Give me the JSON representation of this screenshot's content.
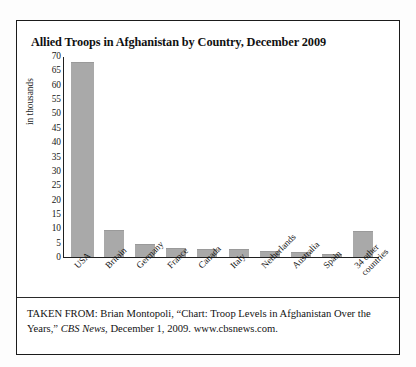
{
  "title": "Allied Troops in Afghanistan by Country, December 2009",
  "source": {
    "prefix": "TAKEN FROM: Brian Montopoli, “Chart: Troop Levels in Afghanistan Over the Years,” ",
    "publication": "CBS News",
    "suffix": ", December 1, 2009. www.cbsnews.com."
  },
  "colors": {
    "bar_fill": "#a9a9a9",
    "frame": "#1b1b1b",
    "axis": "#1f1f1f",
    "text": "#121212"
  },
  "chart_data": {
    "type": "bar",
    "title": "Allied Troops in Afghanistan by Country, December 2009",
    "xlabel": "",
    "ylabel": "in thousands",
    "ylim": [
      0,
      70
    ],
    "ytick_step": 5,
    "yticks": [
      70,
      65,
      60,
      55,
      50,
      45,
      40,
      35,
      30,
      25,
      20,
      15,
      10,
      5,
      0
    ],
    "grid": false,
    "legend": null,
    "categories": [
      "USA",
      "Britain",
      "Germany",
      "France",
      "Canada",
      "Italy",
      "Netherlands",
      "Australia",
      "Spain",
      "34 other countries"
    ],
    "values": [
      68,
      9.5,
      4.5,
      3.1,
      2.8,
      2.8,
      2.1,
      1.6,
      1.1,
      9
    ]
  }
}
